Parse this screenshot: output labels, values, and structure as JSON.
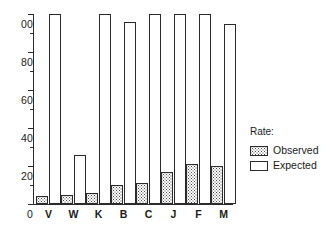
{
  "chart_data": {
    "type": "bar",
    "title": "",
    "subtitle": "",
    "xlabel": "",
    "ylabel": "",
    "categories": [
      "V",
      "W",
      "K",
      "B",
      "C",
      "J",
      "F",
      "M"
    ],
    "series": [
      {
        "name": "Observed",
        "values": [
          4,
          5,
          6,
          10,
          11,
          17,
          21,
          20
        ]
      },
      {
        "name": "Expected",
        "values": [
          100,
          26,
          100,
          96,
          100,
          100,
          100,
          95
        ]
      }
    ],
    "ylim": [
      0,
      100
    ],
    "y_ticks_major": [
      0,
      20,
      40,
      60,
      80,
      100
    ],
    "y_tick_labels": [
      "0",
      "20",
      "40",
      "60",
      "80",
      "00"
    ],
    "y_ticks_minor": [
      10,
      30,
      50,
      70,
      90
    ],
    "grid": false,
    "legend_position": "right",
    "legend": {
      "title": "Rate:",
      "entries": [
        {
          "label": "Observed",
          "pattern": "stippled"
        },
        {
          "label": "Expected",
          "pattern": "open"
        }
      ]
    },
    "colors": {
      "axis": "#2b2b2b",
      "bar_outline": "#2b2b2b",
      "observed_fill": "#ffffff",
      "observed_dots": "#4a4a4a",
      "expected_fill": "#ffffff",
      "background": "#ffffff"
    }
  }
}
